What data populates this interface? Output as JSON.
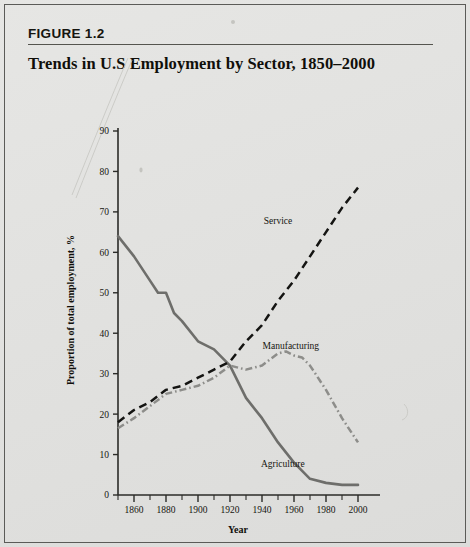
{
  "figure": {
    "number_label": "FIGURE 1.2",
    "title": "Trends in U.S Employment by Sector, 1850–2000"
  },
  "chart_data": {
    "type": "line",
    "title": "Trends in U.S Employment by Sector, 1850–2000",
    "xlabel": "Year",
    "ylabel": "Proportion of total employment, %",
    "xlim": [
      1850,
      2000
    ],
    "ylim": [
      0,
      90
    ],
    "grid": false,
    "legend_position": "inline-annotations",
    "x_tick_labels": [
      "1860",
      "1880",
      "1900",
      "1920",
      "1940",
      "1960",
      "1980",
      "2000"
    ],
    "x_major_ticks": [
      1860,
      1880,
      1900,
      1920,
      1940,
      1960,
      1980,
      2000
    ],
    "x_minor_ticks": [
      1850,
      1870,
      1890,
      1910,
      1930,
      1950,
      1970,
      1990
    ],
    "y_tick_labels": [
      "0",
      "10",
      "20",
      "30",
      "40",
      "50",
      "60",
      "70",
      "80",
      "90"
    ],
    "y_ticks": [
      0,
      10,
      20,
      30,
      40,
      50,
      60,
      70,
      80,
      90
    ],
    "series": [
      {
        "name": "Agriculture",
        "style": "solid",
        "color": "#6e6e6b",
        "label_x": 1953,
        "label_y": 7,
        "x": [
          1850,
          1860,
          1870,
          1875,
          1880,
          1885,
          1890,
          1900,
          1910,
          1920,
          1930,
          1940,
          1950,
          1960,
          1970,
          1980,
          1990,
          2000
        ],
        "values": [
          64,
          59,
          53,
          50,
          50,
          45,
          43,
          38,
          36,
          32,
          24,
          19,
          13,
          8,
          4,
          3,
          2.5,
          2.5
        ]
      },
      {
        "name": "Service",
        "style": "dashed",
        "color": "#141412",
        "label_x": 1950,
        "label_y": 67,
        "x": [
          1850,
          1860,
          1870,
          1880,
          1890,
          1900,
          1910,
          1920,
          1930,
          1940,
          1950,
          1960,
          1970,
          1980,
          1990,
          2000
        ],
        "values": [
          18,
          21,
          23,
          26,
          27,
          29,
          31,
          33,
          38,
          42,
          48,
          53,
          59,
          65,
          71,
          76
        ]
      },
      {
        "name": "Manufacturing",
        "style": "dashdot",
        "color": "#8d8d8a",
        "label_x": 1958,
        "label_y": 36,
        "x": [
          1850,
          1860,
          1870,
          1880,
          1890,
          1900,
          1910,
          1920,
          1930,
          1940,
          1950,
          1955,
          1960,
          1965,
          1970,
          1980,
          1990,
          2000
        ],
        "values": [
          16.5,
          19,
          22,
          25,
          26,
          27,
          29,
          32,
          31,
          32,
          35,
          35.5,
          34.5,
          34,
          32,
          26,
          19,
          13
        ]
      }
    ]
  }
}
